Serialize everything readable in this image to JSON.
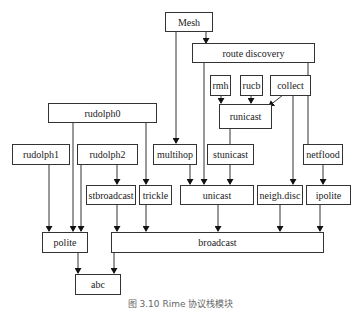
{
  "diagram": {
    "nodes": {
      "mesh": "Mesh",
      "route_discovery": "route discovery",
      "rmh": "rmh",
      "rucb": "rucb",
      "collect": "collect",
      "runicast": "runicast",
      "rudolph0": "rudolph0",
      "rudolph1": "rudolph1",
      "rudolph2": "rudolph2",
      "multihop": "multihop",
      "stunicast": "stunicast",
      "netflood": "netflood",
      "stbroadcast": "stbroadcast",
      "trickle": "trickle",
      "unicast": "unicast",
      "neigh_disc": "neigh.disc",
      "ipolite": "ipolite",
      "polite": "polite",
      "broadcast": "broadcast",
      "abc": "abc"
    },
    "edges": [
      [
        "Mesh",
        "route discovery"
      ],
      [
        "Mesh",
        "multihop"
      ],
      [
        "route discovery",
        "unicast"
      ],
      [
        "route discovery",
        "netflood"
      ],
      [
        "rmh",
        "runicast"
      ],
      [
        "rucb",
        "runicast"
      ],
      [
        "collect",
        "runicast"
      ],
      [
        "collect",
        "neigh.disc"
      ],
      [
        "runicast",
        "stunicast"
      ],
      [
        "stunicast",
        "unicast"
      ],
      [
        "rudolph0",
        "polite"
      ],
      [
        "rudolph0",
        "trickle"
      ],
      [
        "rudolph1",
        "polite"
      ],
      [
        "rudolph2",
        "polite"
      ],
      [
        "rudolph2",
        "stbroadcast"
      ],
      [
        "multihop",
        "unicast"
      ],
      [
        "netflood",
        "ipolite"
      ],
      [
        "stbroadcast",
        "broadcast"
      ],
      [
        "trickle",
        "broadcast"
      ],
      [
        "unicast",
        "broadcast"
      ],
      [
        "neigh.disc",
        "broadcast"
      ],
      [
        "ipolite",
        "broadcast"
      ],
      [
        "polite",
        "abc"
      ],
      [
        "broadcast",
        "abc"
      ]
    ],
    "caption": "图 3.10  Rime 协议栈模块"
  }
}
